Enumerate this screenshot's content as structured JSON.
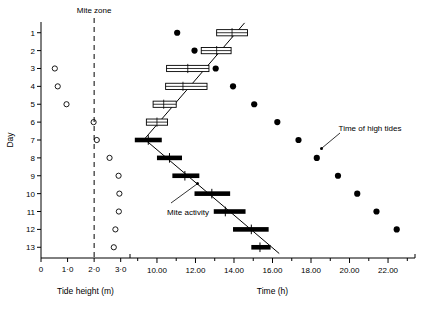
{
  "figure": {
    "title": "",
    "background": "#ffffff",
    "ink": "#000000"
  },
  "left_panel": {
    "name": "tide-height-panel",
    "xlabel": "Tide height (m)",
    "ylabel": "Day",
    "zone_label": "Mite zone",
    "zone_value": 2.0,
    "xticks": [
      0,
      1,
      2,
      3
    ],
    "xticklabels": [
      "0",
      "1·0",
      "2·0",
      "3·0"
    ],
    "yticks": [
      1,
      2,
      3,
      4,
      5,
      6,
      7,
      8,
      9,
      10,
      11,
      12,
      13
    ],
    "yticklabels": [
      "1",
      "2",
      "3",
      "4",
      "5",
      "6",
      "7",
      "8",
      "9",
      "10",
      "11",
      "12",
      "13"
    ],
    "xlim": [
      0,
      3.35
    ],
    "ylim": [
      0.4,
      13.6
    ]
  },
  "right_panel": {
    "name": "time-panel",
    "xlabel": "Time (h)",
    "xticks_major": [
      10,
      12,
      14,
      16,
      18,
      20,
      22
    ],
    "xticklabels": [
      "10.00",
      "12.00",
      "14.00",
      "16.00",
      "18.00",
      "20.00",
      "22.00"
    ],
    "xticks_minor": [
      9,
      11,
      13,
      15,
      17,
      19,
      21,
      23
    ],
    "xlim": [
      8.6,
      23.4
    ],
    "ylim": [
      0.4,
      13.6
    ],
    "annotations": [
      {
        "name": "mite-activity-annotation",
        "text": "Mite activity",
        "day": 9.6,
        "time": 10.4
      },
      {
        "name": "high-tides-annotation",
        "text": "Time of high tides",
        "day": 7.35,
        "time": 18.6
      }
    ]
  },
  "chart_data": {
    "type": "scatter",
    "xlabel": "Time (h)",
    "ylabel": "Day",
    "xlim": [
      8.6,
      23.4
    ],
    "ylim": [
      0.4,
      13.6
    ],
    "grid": false,
    "legend": "none",
    "series": [
      {
        "name": "Tide height (m)",
        "panel": "left",
        "marker": "open-circle",
        "xlabel": "Tide height (m)",
        "points": [
          {
            "day": 3,
            "tide_height": 0.52
          },
          {
            "day": 4,
            "tide_height": 0.63
          },
          {
            "day": 5,
            "tide_height": 0.96
          },
          {
            "day": 6,
            "tide_height": 1.98
          },
          {
            "day": 7,
            "tide_height": 2.1
          },
          {
            "day": 8,
            "tide_height": 2.58
          },
          {
            "day": 9,
            "tide_height": 2.92
          },
          {
            "day": 10,
            "tide_height": 2.95
          },
          {
            "day": 11,
            "tide_height": 2.93
          },
          {
            "day": 12,
            "tide_height": 2.8
          },
          {
            "day": 13,
            "tide_height": 2.74
          }
        ]
      },
      {
        "name": "Time of high tides",
        "panel": "right",
        "marker": "filled-circle",
        "points": [
          {
            "day": 1,
            "time": 11.05
          },
          {
            "day": 2,
            "time": 11.95
          },
          {
            "day": 3,
            "time": 13.05
          },
          {
            "day": 4,
            "time": 13.95
          },
          {
            "day": 5,
            "time": 15.05
          },
          {
            "day": 6,
            "time": 16.25
          },
          {
            "day": 7,
            "time": 17.35
          },
          {
            "day": 8,
            "time": 18.3
          },
          {
            "day": 9,
            "time": 19.4
          },
          {
            "day": 10,
            "time": 20.4
          },
          {
            "day": 11,
            "time": 21.4
          },
          {
            "day": 12,
            "time": 22.45
          }
        ]
      },
      {
        "name": "Mite activity (hollow bars, days 1-6)",
        "panel": "right",
        "marker": "hollow-bar",
        "points": [
          {
            "day": 1,
            "time": 13.9,
            "lo": 13.1,
            "hi": 14.7
          },
          {
            "day": 2,
            "time": 13.1,
            "lo": 12.3,
            "hi": 13.85
          },
          {
            "day": 3,
            "time": 11.6,
            "lo": 10.5,
            "hi": 12.7
          },
          {
            "day": 4,
            "time": 11.35,
            "lo": 10.45,
            "hi": 12.6
          },
          {
            "day": 5,
            "time": 10.35,
            "lo": 9.8,
            "hi": 11.0
          },
          {
            "day": 6,
            "time": 10.0,
            "lo": 9.45,
            "hi": 10.55
          }
        ]
      },
      {
        "name": "Mite activity (solid bars, days 7-13)",
        "panel": "right",
        "marker": "solid-bar",
        "points": [
          {
            "day": 7,
            "time": 9.55,
            "lo": 8.85,
            "hi": 10.25
          },
          {
            "day": 8,
            "time": 10.65,
            "lo": 10.0,
            "hi": 11.3
          },
          {
            "day": 9,
            "time": 11.45,
            "lo": 10.8,
            "hi": 12.2
          },
          {
            "day": 10,
            "time": 12.85,
            "lo": 11.95,
            "hi": 13.8
          },
          {
            "day": 11,
            "time": 13.55,
            "lo": 12.95,
            "hi": 14.6
          },
          {
            "day": 12,
            "time": 14.9,
            "lo": 13.95,
            "hi": 15.8
          },
          {
            "day": 13,
            "time": 15.35,
            "lo": 14.9,
            "hi": 15.9
          }
        ]
      }
    ],
    "regression_lines": [
      {
        "name": "upper-branch",
        "from": {
          "time": 9.35,
          "day": 6.95
        },
        "to": {
          "time": 14.55,
          "day": 0.45
        }
      },
      {
        "name": "lower-branch",
        "from": {
          "time": 9.35,
          "day": 6.95
        },
        "to": {
          "time": 16.35,
          "day": 13.35
        }
      }
    ]
  }
}
